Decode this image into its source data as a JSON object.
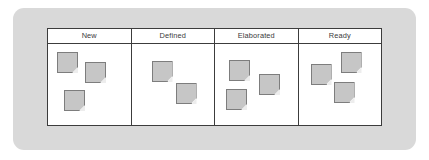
{
  "diagram": {
    "frame_color": "#d9d9d9",
    "board_background": "#ffffff",
    "board_border_color": "#3c3c3c",
    "note_fill": "#c6c6c6",
    "note_border": "#7d7d7d",
    "columns": [
      {
        "label": "New",
        "note_count": 3,
        "notes": [
          {
            "x": 9,
            "y": 8
          },
          {
            "x": 37,
            "y": 18
          },
          {
            "x": 16,
            "y": 46
          }
        ]
      },
      {
        "label": "Defined",
        "note_count": 2,
        "notes": [
          {
            "x": 20,
            "y": 17
          },
          {
            "x": 44,
            "y": 39
          }
        ]
      },
      {
        "label": "Elaborated",
        "note_count": 3,
        "notes": [
          {
            "x": 14,
            "y": 16
          },
          {
            "x": 44,
            "y": 30
          },
          {
            "x": 11,
            "y": 45
          }
        ]
      },
      {
        "label": "Ready",
        "note_count": 3,
        "notes": [
          {
            "x": 12,
            "y": 20
          },
          {
            "x": 42,
            "y": 8
          },
          {
            "x": 35,
            "y": 38
          }
        ]
      }
    ]
  }
}
